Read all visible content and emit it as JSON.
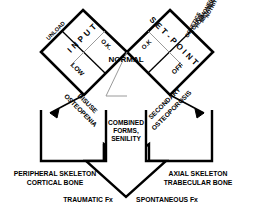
{
  "diagram": {
    "boxes": [
      {
        "id": "input",
        "label": "I N P U T"
      },
      {
        "id": "setpoint",
        "label": "S E T  -  P O I N T"
      }
    ],
    "input_box": {
      "heading": "I N P U T",
      "corner_label": "UNLOAD",
      "cell_ok": "O.K.",
      "cell_low": "LOW"
    },
    "setpoint_box": {
      "heading": "S E T  -  P O I N T",
      "cell_ok": "O.K",
      "cell_off": "OFF",
      "influences": [
        "NUTRITION",
        "METABOLISM",
        "HORMONES",
        "TOXICS",
        "GENETICS"
      ]
    },
    "center_label": "NORMAL",
    "branch_left": "DISUSE OSTEOPENIA",
    "branch_right": "SECONDARY OSTEOPOROSIS",
    "center_arrow_label": [
      "COMBINED",
      "FORMS,",
      "SENILITY"
    ],
    "outcome_left": [
      "PERIPHERAL SKELETON",
      "CORTICAL BONE"
    ],
    "outcome_right": [
      "AXIAL SKELETON",
      "TRABECULAR BONE"
    ],
    "fracture_left": "TRAUMATIC Fx",
    "fracture_right": "SPONTANEOUS Fx",
    "colors": {
      "stroke": "#000000",
      "background": "#ffffff",
      "text": "#000000",
      "thin_stroke": "#555555"
    }
  }
}
